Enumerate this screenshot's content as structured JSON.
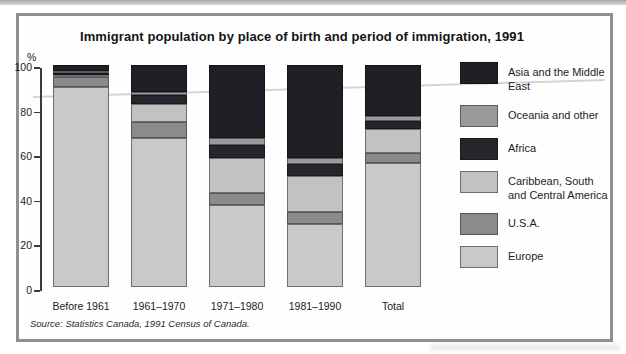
{
  "source_note": "Source: Statistics Canada, 1991 Census of Canada.",
  "chart_data": {
    "type": "bar",
    "stacked": true,
    "title": "Immigrant population by place of birth and period of immigration, 1991",
    "xlabel": "",
    "ylabel": "%",
    "ylim": [
      0,
      100
    ],
    "y_ticks": [
      0,
      20,
      40,
      60,
      80,
      100
    ],
    "grid": false,
    "legend_position": "right",
    "legend_order_top_to_bottom": [
      "Asia and the Middle East",
      "Oceania and other",
      "Africa",
      "Caribbean, South and Central America",
      "U.S.A.",
      "Europe"
    ],
    "categories": [
      "Before 1961",
      "1961–1970",
      "1971–1980",
      "1981–1990",
      "Total"
    ],
    "series": [
      {
        "name": "Europe",
        "color": "#c9c9c9",
        "border": "#6e6e6e",
        "values": [
          90,
          67,
          37,
          28.5,
          56
        ]
      },
      {
        "name": "U.S.A.",
        "color": "#8b8b8b",
        "border": "#565656",
        "values": [
          4.5,
          7.5,
          5.5,
          5.5,
          4.5
        ]
      },
      {
        "name": "Caribbean, South and Central America",
        "color": "#c2c2c2",
        "border": "#6e6e6e",
        "values": [
          1,
          8,
          15.5,
          16,
          10.5
        ]
      },
      {
        "name": "Africa",
        "color": "#26262c",
        "border": "#18181c",
        "values": [
          1,
          4,
          6,
          5.5,
          4
        ]
      },
      {
        "name": "Oceania and other",
        "color": "#9a9a9a",
        "border": "#5a5a5a",
        "values": [
          1,
          1.5,
          3,
          2.5,
          2
        ]
      },
      {
        "name": "Asia and the Middle East",
        "color": "#1f1f26",
        "border": "#121217",
        "values": [
          2.5,
          12,
          33,
          42,
          23
        ]
      }
    ]
  }
}
